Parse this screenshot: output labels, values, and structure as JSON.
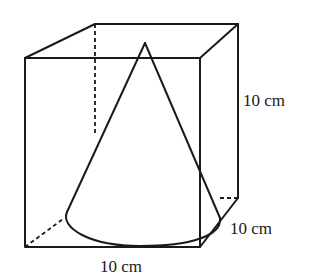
{
  "figure": {
    "labels": {
      "height": "10 cm",
      "depth": "10 cm",
      "width": "10 cm"
    }
  },
  "colors": {
    "line": "#1a1a1a",
    "background": "#ffffff"
  }
}
